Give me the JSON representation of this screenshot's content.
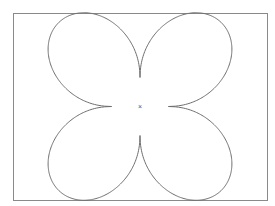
{
  "diagram": {
    "center_marker": "×",
    "stroke_color": "#6e6e6e",
    "frame_color": "#8a8a8a",
    "background": "#ffffff",
    "petals": 4
  }
}
